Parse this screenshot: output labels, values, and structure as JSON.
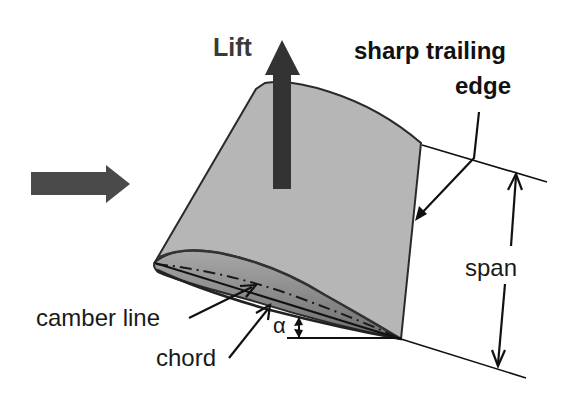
{
  "labels": {
    "lift": "Lift",
    "trailing_edge_line1": "sharp trailing",
    "trailing_edge_line2": "edge",
    "span": "span",
    "camber_line": "camber line",
    "chord": "chord",
    "angle_of_attack": "α"
  },
  "colors": {
    "wing_fill": "#b4b4b4",
    "wing_section_fill": "#9a9a9a",
    "outline": "#2a2a2a",
    "lift_arrow": "#333333",
    "flow_arrow": "#4a4a4a",
    "text": "#1a1a1a",
    "background": "#ffffff"
  },
  "elements": {
    "flow_arrow": "free-stream direction (left to right)",
    "lift_arrow": "lift force, upward",
    "span_dimension": "double-headed arrow between extension lines"
  }
}
